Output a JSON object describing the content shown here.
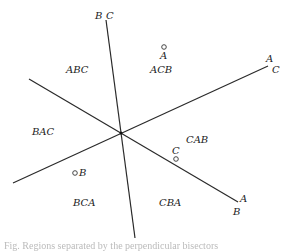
{
  "diagram": {
    "type": "ranking-regions",
    "line_color": "#2a2a2a",
    "point_color": "#333333",
    "center": [
      121,
      133
    ],
    "lines": [
      {
        "id": "line-bc",
        "from": [
          106,
          20
        ],
        "to": [
          135,
          238
        ],
        "end_labels": [
          "B",
          "C"
        ]
      },
      {
        "id": "line-ac",
        "from": [
          13,
          183
        ],
        "to": [
          268,
          66
        ],
        "end_labels": [
          "A",
          "C"
        ]
      },
      {
        "id": "line-ab",
        "from": [
          29,
          79
        ],
        "to": [
          238,
          202
        ],
        "end_labels": [
          "A",
          "B"
        ]
      }
    ],
    "line_end_labels": {
      "top_b": "B",
      "top_c": "C",
      "right_upper_a": "A",
      "right_upper_c": "C",
      "right_lower_a": "A",
      "right_lower_b": "B"
    },
    "regions": [
      {
        "key": "abc",
        "label": "ABC"
      },
      {
        "key": "acb",
        "label": "ACB"
      },
      {
        "key": "bac",
        "label": "BAC"
      },
      {
        "key": "cab",
        "label": "CAB"
      },
      {
        "key": "bca",
        "label": "BCA"
      },
      {
        "key": "cba",
        "label": "CBA"
      }
    ],
    "points": [
      {
        "label": "A",
        "pos": [
          164,
          47
        ]
      },
      {
        "label": "B",
        "pos": [
          75,
          173
        ]
      },
      {
        "label": "C",
        "pos": [
          176,
          159
        ]
      }
    ]
  },
  "caption": "Fig. Regions separated by the perpendicular bisectors"
}
